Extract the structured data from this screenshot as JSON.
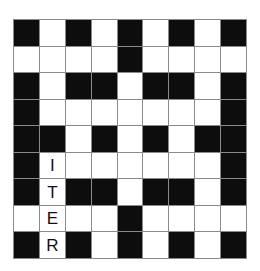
{
  "puzzle": {
    "type": "crossword",
    "rows": 9,
    "cols": 9,
    "colors": {
      "block": "#0d0d0d",
      "open": "#ffffff",
      "gridline": "#8a8a8a",
      "letter": "#111111"
    },
    "grid": [
      [
        "#",
        "",
        "#",
        "",
        "#",
        "",
        "#",
        "",
        "#"
      ],
      [
        "",
        "",
        "",
        "",
        "#",
        "",
        "",
        "",
        ""
      ],
      [
        "#",
        "",
        "#",
        "#",
        "",
        "#",
        "#",
        "",
        "#"
      ],
      [
        "#",
        "",
        "",
        "",
        "",
        "",
        "",
        "",
        "#"
      ],
      [
        "#",
        "#",
        "",
        "#",
        "",
        "#",
        "",
        "#",
        "#"
      ],
      [
        "#",
        "I",
        "",
        "",
        "",
        "",
        "",
        "",
        "#"
      ],
      [
        "#",
        "T",
        "#",
        "#",
        "",
        "#",
        "#",
        "",
        "#"
      ],
      [
        "",
        "E",
        "",
        "",
        "#",
        "",
        "",
        "",
        ""
      ],
      [
        "#",
        "R",
        "#",
        "",
        "#",
        "",
        "#",
        "",
        "#"
      ]
    ],
    "filled_entry": {
      "letters": "ITER",
      "column": 2,
      "start_row": 6,
      "direction": "down"
    }
  }
}
